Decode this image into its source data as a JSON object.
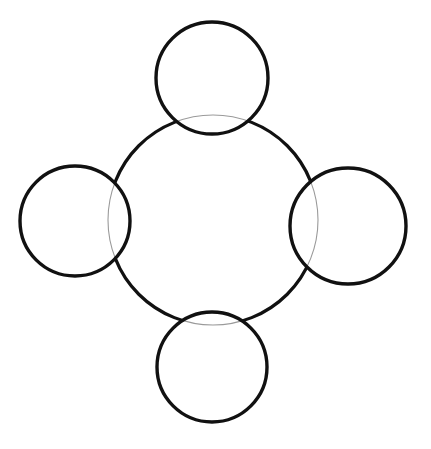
{
  "figure": {
    "title": "",
    "canvas": {
      "width": 431,
      "height": 449,
      "background_color": "#ffffff"
    },
    "stroke_color": "#111111",
    "overlap_stroke_color": "#9a9a9a",
    "shapes": [
      {
        "name": "center-large-circle",
        "role": "hub",
        "cx": 213,
        "cy": 220,
        "r": 105,
        "stroke_width": 3.2,
        "stroke_color": "#111111"
      },
      {
        "name": "top-small-circle",
        "role": "node",
        "position_label": "top",
        "cx": 212,
        "cy": 78,
        "r": 56,
        "stroke_width": 3.4,
        "stroke_color": "#111111"
      },
      {
        "name": "right-small-circle",
        "role": "node",
        "position_label": "right",
        "cx": 348,
        "cy": 226,
        "r": 58,
        "stroke_width": 3.4,
        "stroke_color": "#111111"
      },
      {
        "name": "bottom-small-circle",
        "role": "node",
        "position_label": "bottom",
        "cx": 212,
        "cy": 367,
        "r": 55,
        "stroke_width": 3.4,
        "stroke_color": "#111111"
      },
      {
        "name": "left-small-circle",
        "role": "node",
        "position_label": "left",
        "cx": 75,
        "cy": 221,
        "r": 55,
        "stroke_width": 3.4,
        "stroke_color": "#111111"
      }
    ],
    "labels": []
  }
}
